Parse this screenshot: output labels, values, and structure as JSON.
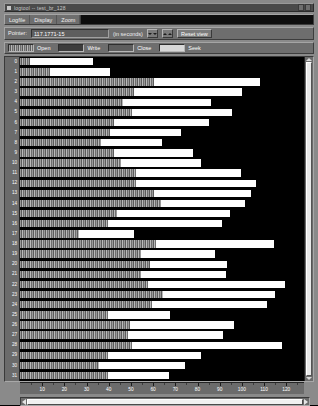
{
  "window": {
    "title": "logtool  --  test_br_128",
    "menu": [
      "Logfile",
      "Display",
      "Zoom"
    ],
    "controls": [
      "minimize-button",
      "maximize-button"
    ]
  },
  "pointer_panel": {
    "label": "Pointer:",
    "value": "117.1771-15",
    "placeholder": "0.0000",
    "units": "(in seconds)",
    "zoom_out_label": "◄►",
    "zoom_in_label": "►◄",
    "reset_label": "Reset view"
  },
  "legend": {
    "items": [
      {
        "label": "Open",
        "color": "#9a9a9a",
        "swatch": "striped"
      },
      {
        "label": "Write",
        "color": "#3c3c3c",
        "swatch": "dark"
      },
      {
        "label": "Close",
        "color": "#5e5e5e",
        "swatch": "mid"
      },
      {
        "label": "Seek",
        "color": "#d8d8d8",
        "swatch": "light"
      }
    ]
  },
  "chart_data": {
    "type": "bar",
    "title": "logtool  --  test_br_128",
    "xlabel": "(in seconds)",
    "ylabel": "thread",
    "xlim": [
      0,
      128
    ],
    "xticks": [
      10,
      20,
      30,
      40,
      50,
      60,
      70,
      80,
      90,
      100,
      110,
      120
    ],
    "grid": false,
    "legend_position": "top",
    "categories": [
      "0",
      "1",
      "2",
      "3",
      "4",
      "5",
      "6",
      "7",
      "8",
      "9",
      "10",
      "11",
      "12",
      "13",
      "14",
      "15",
      "16",
      "17",
      "18",
      "19",
      "20",
      "21",
      "22",
      "23",
      "24",
      "25",
      "26",
      "27",
      "28",
      "29",
      "30",
      "31"
    ],
    "series": [
      {
        "name": "wait",
        "values": [
          4.5,
          13.5,
          60.5,
          51.5,
          46.5,
          50.5,
          42.5,
          40.5,
          36.5,
          42.5,
          45.5,
          52.5,
          52.5,
          60.5,
          63.5,
          43.5,
          39.5,
          26.5,
          61.5,
          54.5,
          58.5,
          54.5,
          57.5,
          64.5,
          59.5,
          39.5,
          49.5,
          48.5,
          50.5,
          39.5,
          35.5,
          39.5
        ]
      },
      {
        "name": "run",
        "values": [
          33.0,
          40.5,
          108.0,
          100.0,
          86.0,
          95.5,
          85.0,
          72.5,
          64.0,
          78.0,
          81.5,
          99.5,
          106.5,
          104.0,
          101.5,
          94.5,
          91.0,
          51.5,
          114.5,
          88.0,
          93.5,
          93.0,
          119.5,
          115.0,
          111.5,
          67.5,
          96.5,
          91.5,
          118.0,
          81.5,
          74.5,
          67.0
        ]
      }
    ]
  },
  "scrollbars": {
    "vertical": {
      "name": "vertical-scrollbar",
      "position": 0
    },
    "horizontal": {
      "name": "horizontal-scrollbar",
      "position": 0
    }
  }
}
